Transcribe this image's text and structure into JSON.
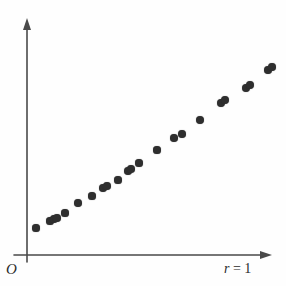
{
  "figure": {
    "background_color": "#fefefe",
    "axis_color": "#4a4a4a",
    "point_color": "#2e2e2e"
  },
  "labels": {
    "origin": "O",
    "x_axis_symbol": "r",
    "x_axis_equals": " = ",
    "x_axis_value": "1",
    "x_axis_full": "r = 1"
  },
  "chart_data": {
    "type": "scatter",
    "title": "",
    "subtitle": "",
    "xlabel": "r = 1",
    "ylabel": "",
    "annotations": [
      "O",
      "r = 1"
    ],
    "legend": [],
    "legend_position": "none",
    "grid": false,
    "axis_style": "arrow-headed open axes, no tick marks, no tick labels",
    "xlim": [
      0,
      1
    ],
    "ylim": [
      0,
      1
    ],
    "correlation": 1,
    "series": [
      {
        "name": "points",
        "x": [
          0.035,
          0.085,
          0.1,
          0.11,
          0.14,
          0.185,
          0.235,
          0.275,
          0.29,
          0.33,
          0.365,
          0.375,
          0.405,
          0.47,
          0.53,
          0.56,
          0.625,
          0.7,
          0.715,
          0.79,
          0.805,
          0.87,
          0.885,
          0.955
        ],
        "y": [
          0.12,
          0.15,
          0.16,
          0.165,
          0.185,
          0.225,
          0.255,
          0.285,
          0.295,
          0.32,
          0.355,
          0.365,
          0.39,
          0.44,
          0.49,
          0.505,
          0.56,
          0.63,
          0.64,
          0.69,
          0.7,
          0.76,
          0.775,
          0.82
        ]
      }
    ],
    "points_px": [
      {
        "x": 36,
        "y": 228,
        "r": 3.6
      },
      {
        "x": 50,
        "y": 221,
        "r": 3.6
      },
      {
        "x": 54,
        "y": 219,
        "r": 3.8
      },
      {
        "x": 57,
        "y": 218,
        "r": 3.8
      },
      {
        "x": 65,
        "y": 213,
        "r": 3.6
      },
      {
        "x": 78,
        "y": 203,
        "r": 3.8
      },
      {
        "x": 92,
        "y": 196,
        "r": 3.6
      },
      {
        "x": 103,
        "y": 188,
        "r": 3.8
      },
      {
        "x": 107,
        "y": 186,
        "r": 3.8
      },
      {
        "x": 118,
        "y": 180,
        "r": 3.6
      },
      {
        "x": 128,
        "y": 171,
        "r": 3.8
      },
      {
        "x": 131,
        "y": 169,
        "r": 3.8
      },
      {
        "x": 139,
        "y": 163,
        "r": 3.6
      },
      {
        "x": 157,
        "y": 150,
        "r": 3.6
      },
      {
        "x": 174,
        "y": 138,
        "r": 3.8
      },
      {
        "x": 182,
        "y": 134,
        "r": 3.8
      },
      {
        "x": 200,
        "y": 120,
        "r": 4.0
      },
      {
        "x": 221,
        "y": 103,
        "r": 3.9
      },
      {
        "x": 225,
        "y": 100,
        "r": 3.9
      },
      {
        "x": 246,
        "y": 88,
        "r": 3.9
      },
      {
        "x": 250,
        "y": 85,
        "r": 3.9
      },
      {
        "x": 268,
        "y": 70,
        "r": 3.8
      },
      {
        "x": 272,
        "y": 67,
        "r": 3.8
      },
      {
        "x": 292,
        "y": 56,
        "r": 3.8
      }
    ]
  }
}
